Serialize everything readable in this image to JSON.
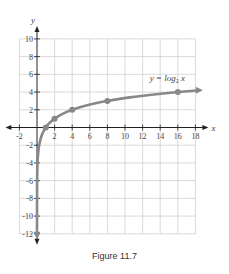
{
  "figure": {
    "caption": "Figure 11.7"
  },
  "chart_data": {
    "type": "line",
    "title": "",
    "function_label": "y = log₂ x",
    "function_label_parts": {
      "lhs": "y = log",
      "sub": "2",
      "rhs": " x"
    },
    "xlabel": "x",
    "ylabel": "y",
    "xlim": [
      -2,
      18
    ],
    "ylim": [
      -12,
      10
    ],
    "x_ticks": [
      -2,
      2,
      4,
      6,
      8,
      10,
      12,
      14,
      16,
      18
    ],
    "y_ticks": [
      10,
      8,
      6,
      4,
      2,
      -2,
      -4,
      -6,
      -8,
      -10,
      -12
    ],
    "grid": true,
    "series": [
      {
        "name": "y = log2 x",
        "points": [
          {
            "x": 1,
            "y": 0
          },
          {
            "x": 2,
            "y": 1
          },
          {
            "x": 4,
            "y": 2
          },
          {
            "x": 8,
            "y": 3
          },
          {
            "x": 16,
            "y": 4
          }
        ],
        "color": "#888888",
        "asymptote": "x = 0",
        "arrow_ends": [
          "down",
          "right"
        ]
      }
    ]
  }
}
